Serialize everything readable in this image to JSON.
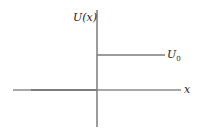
{
  "diagram": {
    "type": "step-potential",
    "y_axis_label": "U(x)",
    "x_axis_label": "x",
    "step_label": "U",
    "step_label_sub": "0",
    "colors": {
      "axis": "#7a7a7a",
      "step": "#7a7a7a",
      "text": "#222222"
    }
  }
}
